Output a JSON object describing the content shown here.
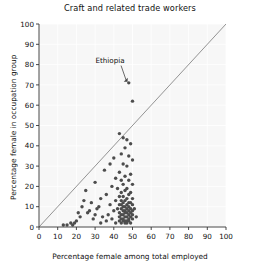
{
  "chart_data": {
    "type": "scatter",
    "title": "Craft and related trade workers",
    "xlabel": "Percentage female among total employed",
    "ylabel": "Percentage female in occupation group",
    "xlim": [
      0,
      100
    ],
    "ylim": [
      0,
      100
    ],
    "xticks": [
      0,
      10,
      20,
      30,
      40,
      50,
      60,
      70,
      80,
      90,
      100
    ],
    "yticks": [
      0,
      10,
      20,
      30,
      40,
      50,
      60,
      70,
      80,
      90,
      100
    ],
    "grid": true,
    "legend": null,
    "reference_line": {
      "type": "identity",
      "from": [
        0,
        0
      ],
      "to": [
        100,
        100
      ],
      "label": "y = x"
    },
    "annotations": [
      {
        "text": "Ethiopia",
        "point": [
          48,
          71
        ],
        "label_at": [
          38,
          81
        ]
      }
    ],
    "series": [
      {
        "name": "countries",
        "marker": "circle",
        "color": "#4d4d4d",
        "points": [
          [
            48,
            71
          ],
          [
            50,
            62
          ],
          [
            43,
            46
          ],
          [
            45,
            44
          ],
          [
            47,
            43
          ],
          [
            49,
            41
          ],
          [
            46,
            39
          ],
          [
            44,
            36
          ],
          [
            48,
            35
          ],
          [
            40,
            34
          ],
          [
            50,
            33
          ],
          [
            38,
            31
          ],
          [
            45,
            31
          ],
          [
            47,
            30
          ],
          [
            35,
            28
          ],
          [
            43,
            27
          ],
          [
            49,
            26
          ],
          [
            46,
            25
          ],
          [
            41,
            24
          ],
          [
            44,
            23
          ],
          [
            48,
            23
          ],
          [
            30,
            22
          ],
          [
            45,
            21
          ],
          [
            50,
            21
          ],
          [
            39,
            20
          ],
          [
            47,
            19
          ],
          [
            42,
            19
          ],
          [
            25,
            18
          ],
          [
            46,
            18
          ],
          [
            44,
            17
          ],
          [
            49,
            17
          ],
          [
            36,
            16
          ],
          [
            48,
            16
          ],
          [
            43,
            15
          ],
          [
            45,
            15
          ],
          [
            33,
            14
          ],
          [
            47,
            14
          ],
          [
            50,
            14
          ],
          [
            41,
            13
          ],
          [
            44,
            13
          ],
          [
            46,
            13
          ],
          [
            28,
            12
          ],
          [
            48,
            12
          ],
          [
            45,
            12
          ],
          [
            49,
            12
          ],
          [
            38,
            11
          ],
          [
            43,
            11
          ],
          [
            47,
            11
          ],
          [
            44,
            11
          ],
          [
            50,
            11
          ],
          [
            23,
            10
          ],
          [
            46,
            10
          ],
          [
            48,
            10
          ],
          [
            45,
            10
          ],
          [
            42,
            9
          ],
          [
            49,
            9
          ],
          [
            47,
            9
          ],
          [
            31,
            9
          ],
          [
            44,
            9
          ],
          [
            46,
            8
          ],
          [
            50,
            8
          ],
          [
            40,
            8
          ],
          [
            48,
            8
          ],
          [
            45,
            8
          ],
          [
            43,
            7
          ],
          [
            47,
            7
          ],
          [
            49,
            7
          ],
          [
            26,
            7
          ],
          [
            46,
            7
          ],
          [
            44,
            6
          ],
          [
            48,
            6
          ],
          [
            50,
            6
          ],
          [
            37,
            6
          ],
          [
            45,
            6
          ],
          [
            43,
            5
          ],
          [
            47,
            5
          ],
          [
            49,
            5
          ],
          [
            34,
            5
          ],
          [
            46,
            5
          ],
          [
            44,
            4
          ],
          [
            48,
            4
          ],
          [
            29,
            4
          ],
          [
            45,
            4
          ],
          [
            50,
            4
          ],
          [
            47,
            3
          ],
          [
            43,
            3
          ],
          [
            46,
            3
          ],
          [
            48,
            3
          ],
          [
            20,
            3
          ],
          [
            45,
            3
          ],
          [
            44,
            2
          ],
          [
            49,
            2
          ],
          [
            47,
            2
          ],
          [
            46,
            2
          ],
          [
            18,
            1
          ],
          [
            15,
            1
          ],
          [
            13,
            1
          ],
          [
            19,
            2
          ],
          [
            22,
            5
          ],
          [
            27,
            8
          ],
          [
            32,
            10
          ],
          [
            24,
            13
          ],
          [
            21,
            7
          ],
          [
            36,
            3
          ],
          [
            39,
            4
          ],
          [
            41,
            2
          ],
          [
            51,
            9
          ],
          [
            52,
            5
          ],
          [
            30,
            6
          ],
          [
            33,
            2
          ],
          [
            17,
            2
          ]
        ]
      }
    ]
  }
}
